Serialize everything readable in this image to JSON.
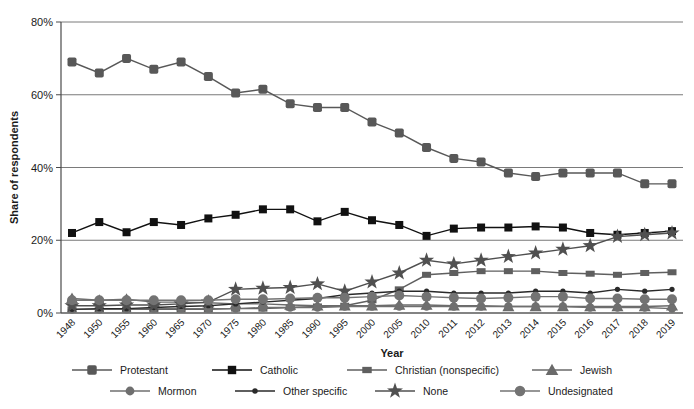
{
  "chart_data": {
    "type": "line",
    "title": "",
    "xlabel": "Year",
    "ylabel": "Share of respondents",
    "grid": "horizontal",
    "legend_position": "bottom",
    "ylim": [
      0,
      80
    ],
    "yticks": [
      "0%",
      "20%",
      "40%",
      "60%",
      "80%"
    ],
    "ytick_values": [
      0,
      20,
      40,
      60,
      80
    ],
    "categories": [
      "1948",
      "1950",
      "1955",
      "1960",
      "1965",
      "1970",
      "1975",
      "1980",
      "1985",
      "1990",
      "1995",
      "2000",
      "2005",
      "2010",
      "2011",
      "2012",
      "2013",
      "2014",
      "2015",
      "2016",
      "2017",
      "2018",
      "2019"
    ],
    "series": [
      {
        "name": "Protestant",
        "marker": "square-large",
        "color": "#585858",
        "values": [
          69,
          66,
          70,
          67,
          69,
          65,
          60.5,
          61.5,
          57.5,
          56.5,
          56.5,
          52.5,
          49.5,
          45.5,
          42.5,
          41.5,
          38.5,
          37.5,
          38.5,
          38.5,
          38.5,
          35.5,
          35.5
        ]
      },
      {
        "name": "Catholic",
        "marker": "square-black",
        "color": "#111111",
        "values": [
          22,
          25,
          22.2,
          25,
          24.2,
          26,
          27,
          28.5,
          28.5,
          25.2,
          27.8,
          25.5,
          24.2,
          21.2,
          23.2,
          23.5,
          23.5,
          23.8,
          23.5,
          22,
          21.5,
          22,
          22.5
        ]
      },
      {
        "name": "Christian (nonspecific)",
        "marker": "square-small",
        "color": "#5f5f5f",
        "values": [
          1,
          1,
          1,
          1,
          1,
          1,
          1.2,
          1.2,
          1.5,
          1.8,
          2,
          3.5,
          6.5,
          10.5,
          11,
          11.5,
          11.5,
          11.5,
          11,
          10.8,
          10.5,
          11,
          11.2
        ]
      },
      {
        "name": "Jewish",
        "marker": "triangle",
        "color": "#6a6a6a",
        "values": [
          4,
          3.5,
          3.8,
          3,
          3,
          2.8,
          2.5,
          2.5,
          2.2,
          2,
          2,
          2,
          2.2,
          2.2,
          2,
          2,
          1.8,
          1.8,
          1.8,
          1.8,
          1.8,
          1.8,
          2
        ]
      },
      {
        "name": "Mormon",
        "marker": "circle",
        "color": "#6f6f6f",
        "values": [
          1,
          1,
          1,
          1.2,
          1.2,
          1.2,
          1.2,
          1.5,
          1.5,
          1.5,
          1.8,
          1.8,
          1.8,
          1.8,
          1.8,
          1.8,
          1.8,
          1.8,
          1.8,
          1.5,
          1.5,
          1.5,
          1.2
        ]
      },
      {
        "name": "Other specific",
        "marker": "dot",
        "color": "#2a2a2a",
        "values": [
          1,
          1.2,
          1.2,
          1.5,
          1.8,
          2,
          2.5,
          3,
          3.5,
          4,
          5,
          5.5,
          6,
          6,
          5.5,
          5.5,
          5.5,
          6,
          6,
          5.5,
          6.5,
          6,
          6.5
        ]
      },
      {
        "name": "None",
        "marker": "star",
        "color": "#505050",
        "values": [
          2,
          2,
          2.2,
          2.2,
          2.5,
          3,
          6.5,
          6.8,
          7,
          8,
          6,
          8.5,
          11,
          14.5,
          13.5,
          14.5,
          15.5,
          16.5,
          17.5,
          18.5,
          21,
          21.5,
          22
        ]
      },
      {
        "name": "Undesignated",
        "marker": "circle-large",
        "color": "#737373",
        "values": [
          3.5,
          3.5,
          3.5,
          3.5,
          3.5,
          3.5,
          3.8,
          3.8,
          4,
          4.2,
          4.2,
          4.5,
          4.8,
          4.5,
          4.2,
          4,
          4.2,
          4.5,
          4.5,
          4,
          4,
          3.8,
          3.8
        ]
      }
    ]
  },
  "legend": {
    "rows": [
      [
        "Protestant",
        "Catholic",
        "Christian (nonspecific)",
        "Jewish"
      ],
      [
        "Mormon",
        "Other specific",
        "None",
        "Undesignated"
      ]
    ]
  }
}
